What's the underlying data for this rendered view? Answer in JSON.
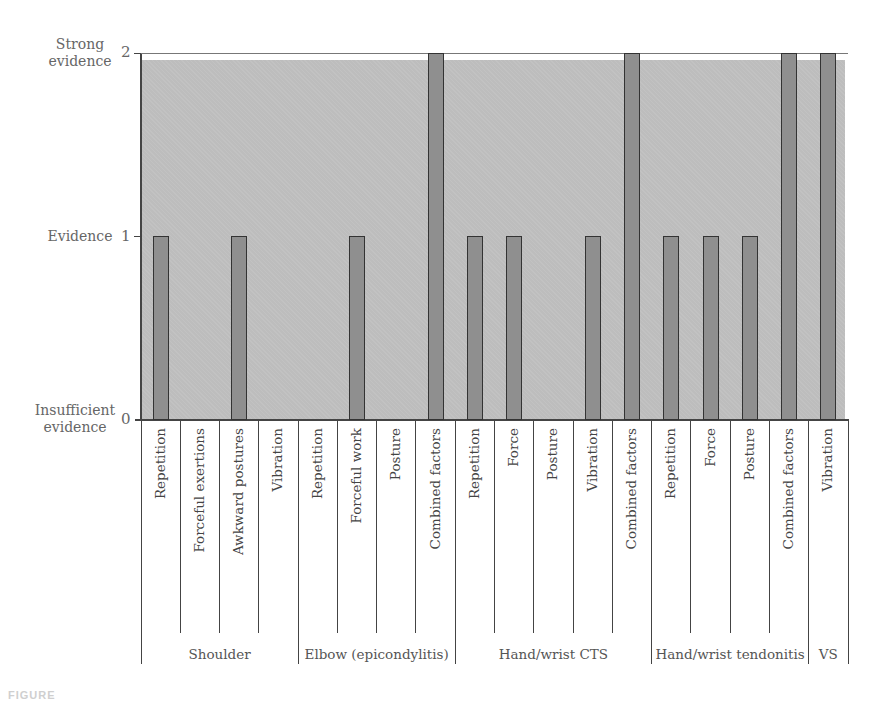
{
  "chart_data": {
    "type": "bar",
    "title": "",
    "xlabel": "",
    "ylabel": "",
    "ylim": [
      0,
      2
    ],
    "y_ticks": [
      {
        "value": 0,
        "label": "0",
        "name": "Insufficient evidence"
      },
      {
        "value": 1,
        "label": "1",
        "name": "Evidence"
      },
      {
        "value": 2,
        "label": "2",
        "name": "Strong evidence"
      }
    ],
    "categories": [
      "Repetition",
      "Forceful exertions",
      "Awkward postures",
      "Vibration",
      "Repetition",
      "Forceful work",
      "Posture",
      "Combined factors",
      "Repetition",
      "Force",
      "Posture",
      "Vibration",
      "Combined factors",
      "Repetition",
      "Force",
      "Posture",
      "Combined factors",
      "Vibration"
    ],
    "values": [
      1,
      0,
      1,
      0,
      0,
      1,
      0,
      2,
      1,
      1,
      0,
      1,
      2,
      1,
      1,
      1,
      2,
      2
    ],
    "groups": [
      {
        "label": "Shoulder",
        "start": 0,
        "count": 4
      },
      {
        "label": "Elbow (epicondylitis)",
        "start": 4,
        "count": 4
      },
      {
        "label": "Hand/wrist CTS",
        "start": 8,
        "count": 5
      },
      {
        "label": "Hand/wrist tendonitis",
        "start": 13,
        "count": 4
      },
      {
        "label": "VS",
        "start": 17,
        "count": 1
      }
    ],
    "grid": false,
    "legend": null
  },
  "axis": {
    "y_names": {
      "strong": "Strong\nevidence",
      "evidence": "Evidence",
      "insufficient": "Insufficient\nevidence"
    },
    "tick_2": "2",
    "tick_1": "1",
    "tick_0": "0"
  },
  "caption": {
    "text": "FIGURE"
  },
  "colors": {
    "background_fill": "#bdbdbd",
    "bar_fill": "#8f8f8f",
    "bar_border": "#333333",
    "axis": "#444444"
  }
}
